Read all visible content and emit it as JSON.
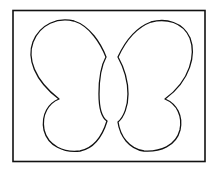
{
  "drawing": {
    "subject": "butterfly outline",
    "stroke_color": "#111111",
    "background_color": "#ffffff",
    "frame": {
      "x": 12,
      "y": 10,
      "width": 193,
      "height": 152
    }
  }
}
